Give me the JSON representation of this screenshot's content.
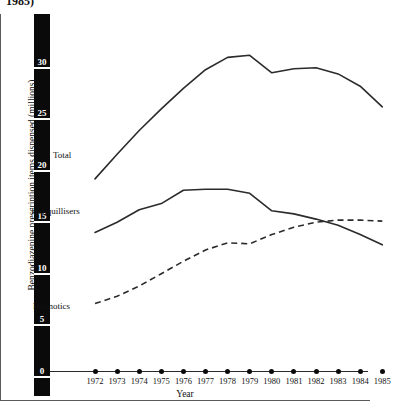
{
  "figure": {
    "title_visible_fragment": "1985)",
    "ylabel": "Benzodiazepine prescription items dispensed (millions)",
    "xlabel": "Year"
  },
  "yaxis": {
    "ticks": [
      "30",
      "25",
      "20",
      "15",
      "10",
      "5",
      "0"
    ]
  },
  "series_labels": {
    "total": "Total",
    "tranquillisers": "Tranquillisers",
    "hypnotics": "Hypnotics"
  },
  "chart_data": {
    "type": "line",
    "title": "1985)",
    "xlabel": "Year",
    "ylabel": "Benzodiazepine prescription items dispensed (millions)",
    "x": [
      1972,
      1973,
      1974,
      1975,
      1976,
      1977,
      1978,
      1979,
      1980,
      1981,
      1982,
      1983,
      1984,
      1985
    ],
    "categories": [
      "1972",
      "1973",
      "1974",
      "1975",
      "1976",
      "1977",
      "1978",
      "1979",
      "1980",
      "1981",
      "1982",
      "1983",
      "1984",
      "1985"
    ],
    "xlim": [
      1972,
      1985
    ],
    "ylim": [
      0,
      32
    ],
    "yticks": [
      0,
      5,
      10,
      15,
      20,
      25,
      30
    ],
    "grid": false,
    "legend": "inline-annotations",
    "series": [
      {
        "name": "Total",
        "style": "solid",
        "values": [
          18.6,
          21.0,
          23.3,
          25.4,
          27.4,
          29.2,
          30.4,
          30.6,
          28.9,
          29.3,
          29.4,
          28.8,
          27.6,
          25.6
        ]
      },
      {
        "name": "Tranquillisers",
        "style": "solid",
        "values": [
          13.4,
          14.4,
          15.6,
          16.2,
          17.5,
          17.6,
          17.6,
          17.2,
          15.5,
          15.2,
          14.7,
          14.1,
          13.2,
          12.2
        ]
      },
      {
        "name": "Hypnotics",
        "style": "dashed",
        "values": [
          6.5,
          7.2,
          8.2,
          9.4,
          10.6,
          11.7,
          12.4,
          12.3,
          13.2,
          13.9,
          14.4,
          14.6,
          14.6,
          14.5
        ]
      }
    ]
  }
}
